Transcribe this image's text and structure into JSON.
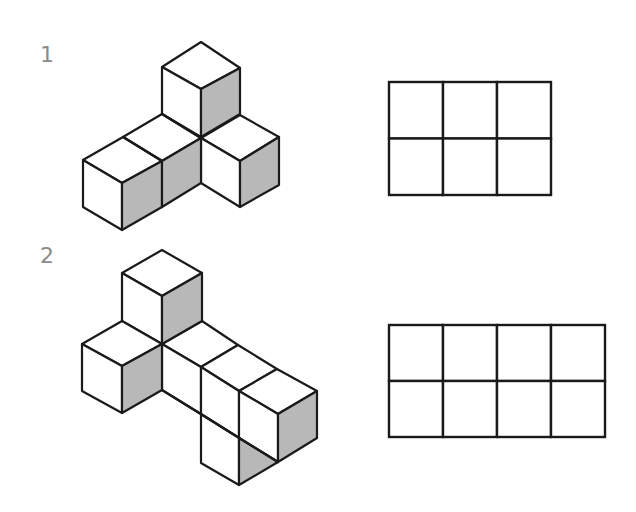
{
  "colors": {
    "stroke": "#1a1a1a",
    "shade": "#b8b8b8",
    "face": "#ffffff",
    "label": "#8a8a8a"
  },
  "problems": [
    {
      "number": "1",
      "label_pos": [
        40,
        44
      ],
      "figure": {
        "description": "isometric arrangement of 5 cubes",
        "white_faces": [
          [
            [
              201,
              42
            ],
            [
              240,
              68
            ],
            [
              201,
              89
            ],
            [
              162,
              67
            ]
          ],
          [
            [
              162,
              67
            ],
            [
              201,
              89
            ],
            [
              201,
              137
            ],
            [
              162,
              114
            ]
          ],
          [
            [
              123,
              137
            ],
            [
              162,
              114
            ],
            [
              201,
              138
            ],
            [
              162,
              161
            ]
          ],
          [
            [
              83,
              160
            ],
            [
              123,
              137
            ],
            [
              162,
              161
            ],
            [
              122,
              183
            ]
          ],
          [
            [
              83,
              160
            ],
            [
              122,
              183
            ],
            [
              122,
              230
            ],
            [
              83,
              207
            ]
          ],
          [
            [
              201,
              138
            ],
            [
              240,
              115
            ],
            [
              279,
              137
            ],
            [
              240,
              161
            ]
          ],
          [
            [
              201,
              138
            ],
            [
              240,
              161
            ],
            [
              240,
              207
            ],
            [
              201,
              183
            ]
          ]
        ],
        "shaded_faces": [
          [
            [
              201,
              89
            ],
            [
              240,
              68
            ],
            [
              240,
              114
            ],
            [
              201,
              137
            ]
          ],
          [
            [
              122,
              183
            ],
            [
              162,
              161
            ],
            [
              162,
              207
            ],
            [
              122,
              230
            ]
          ],
          [
            [
              162,
              161
            ],
            [
              201,
              138
            ],
            [
              201,
              183
            ],
            [
              162,
              207
            ]
          ],
          [
            [
              240,
              161
            ],
            [
              279,
              137
            ],
            [
              279,
              185
            ],
            [
              240,
              207
            ]
          ]
        ],
        "lines": [
          [
            [
              162,
              114
            ],
            [
              201,
              138
            ]
          ],
          [
            [
              123,
              137
            ],
            [
              162,
              161
            ]
          ]
        ]
      },
      "grid": {
        "x": 389,
        "y": 82,
        "cols": 3,
        "rows": 2,
        "cell_w": 54,
        "cell_h": 56.5
      }
    },
    {
      "number": "2",
      "label_pos": [
        40,
        244
      ],
      "figure": {
        "description": "isometric arrangement of cubes with hidden-view ambiguity",
        "white_faces": [
          [
            [
              162,
              250
            ],
            [
              202,
              273
            ],
            [
              162,
              296
            ],
            [
              122,
              273
            ]
          ],
          [
            [
              122,
              273
            ],
            [
              162,
              296
            ],
            [
              162,
              344
            ],
            [
              122,
              321
            ]
          ],
          [
            [
              82,
              344
            ],
            [
              122,
              321
            ],
            [
              162,
              344
            ],
            [
              122,
              366
            ]
          ],
          [
            [
              82,
              344
            ],
            [
              122,
              366
            ],
            [
              122,
              413
            ],
            [
              82,
              391
            ]
          ],
          [
            [
              162,
              344
            ],
            [
              202,
              321
            ],
            [
              238,
              345
            ],
            [
              201,
              367
            ]
          ],
          [
            [
              201,
              367
            ],
            [
              238,
              345
            ],
            [
              277,
              369
            ],
            [
              239,
              391
            ]
          ],
          [
            [
              239,
              391
            ],
            [
              277,
              369
            ],
            [
              317,
              391
            ],
            [
              278,
              414
            ]
          ],
          [
            [
              162,
              344
            ],
            [
              201,
              367
            ],
            [
              201,
              414
            ],
            [
              162,
              390
            ]
          ],
          [
            [
              201,
              367
            ],
            [
              239,
              391
            ],
            [
              239,
              438
            ],
            [
              201,
              414
            ]
          ],
          [
            [
              239,
              391
            ],
            [
              278,
              414
            ],
            [
              278,
              462
            ],
            [
              239,
              438
            ]
          ],
          [
            [
              201,
              414
            ],
            [
              239,
              438
            ],
            [
              239,
              485
            ],
            [
              201,
              463
            ]
          ]
        ],
        "shaded_faces": [
          [
            [
              162,
              296
            ],
            [
              202,
              273
            ],
            [
              202,
              321
            ],
            [
              162,
              344
            ]
          ],
          [
            [
              122,
              366
            ],
            [
              162,
              344
            ],
            [
              162,
              390
            ],
            [
              122,
              413
            ]
          ],
          [
            [
              278,
              414
            ],
            [
              317,
              391
            ],
            [
              317,
              438
            ],
            [
              278,
              462
            ]
          ],
          [
            [
              239,
              438
            ],
            [
              278,
              462
            ],
            [
              239,
              485
            ]
          ]
        ],
        "lines": [
          [
            [
              162,
              390
            ],
            [
              278,
              462
            ]
          ]
        ]
      },
      "grid": {
        "x": 389,
        "y": 325,
        "cols": 4,
        "rows": 2,
        "cell_w": 54,
        "cell_h": 56
      }
    }
  ]
}
